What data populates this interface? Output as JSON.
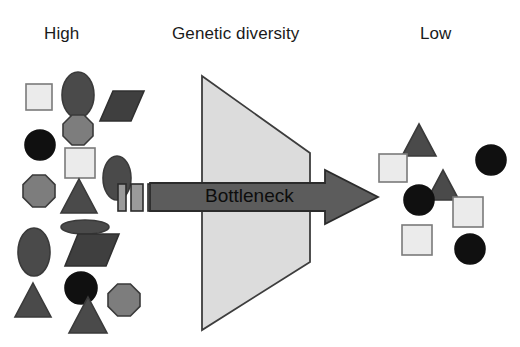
{
  "diagram": {
    "title": "Genetic diversity",
    "left_label": "High",
    "right_label": "Low",
    "arrow_label": "Bottleneck",
    "colors": {
      "background": "#ffffff",
      "text": "#1a1a1a",
      "funnel_fill": "#dcdcdc",
      "funnel_stroke": "#3d3d3d",
      "arrow_fill": "#5c5c5c",
      "arrow_stroke": "#2b2b2b",
      "shape_light": "#ebebeb",
      "shape_mid": "#7d7d7d",
      "shape_dark": "#4a4a4a",
      "shape_black": "#101010",
      "shape_outline": "#3a3a3a"
    },
    "funnel": {
      "points": "202,76 310,153 310,262 202,330",
      "fill": "#dcdcdc",
      "stroke": "#3d3d3d"
    },
    "arrow": {
      "points": "150,183 325,183 325,170 378,197 325,224 325,211 150,211",
      "fill": "#5c5c5c",
      "stroke": "#2b2b2b",
      "label_x": 205,
      "label_y": 197
    },
    "gate_bars": [
      {
        "x": 118,
        "y": 184,
        "w": 8,
        "h": 27,
        "fill": "#9a9a9a"
      },
      {
        "x": 131,
        "y": 184,
        "w": 12,
        "h": 27,
        "fill": "#9a9a9a"
      },
      {
        "x": 148,
        "y": 184,
        "w": 10,
        "h": 27,
        "fill": "#9a9a9a"
      }
    ],
    "left_population": {
      "caption": "High genetic diversity population",
      "shape_type_count": 6,
      "shape_count": 18,
      "shapes": [
        {
          "kind": "square",
          "cx": 39,
          "cy": 97,
          "w": 26,
          "h": 26,
          "fill": "#ebebeb",
          "stroke": "#7a7a7a"
        },
        {
          "kind": "ellipse",
          "cx": 78,
          "cy": 95,
          "w": 32,
          "h": 46,
          "fill": "#4a4a4a",
          "stroke": "#3a3a3a"
        },
        {
          "kind": "parallelogram",
          "cx": 122,
          "cy": 106,
          "w": 44,
          "h": 30,
          "fill": "#3f3f3f",
          "stroke": "#303030",
          "skew": 13
        },
        {
          "kind": "octagon",
          "cx": 78,
          "cy": 130,
          "w": 30,
          "h": 30,
          "fill": "#7d7d7d",
          "stroke": "#3a3a3a"
        },
        {
          "kind": "circle",
          "cx": 40,
          "cy": 145,
          "w": 30,
          "h": 30,
          "fill": "#101010",
          "stroke": "#101010"
        },
        {
          "kind": "square",
          "cx": 80,
          "cy": 163,
          "w": 30,
          "h": 30,
          "fill": "#ebebeb",
          "stroke": "#7a7a7a"
        },
        {
          "kind": "ellipse",
          "cx": 117,
          "cy": 178,
          "w": 28,
          "h": 44,
          "fill": "#4a4a4a",
          "stroke": "#3a3a3a"
        },
        {
          "kind": "octagon",
          "cx": 39,
          "cy": 191,
          "w": 32,
          "h": 32,
          "fill": "#7d7d7d",
          "stroke": "#3a3a3a"
        },
        {
          "kind": "triangle",
          "cx": 79,
          "cy": 196,
          "w": 36,
          "h": 34,
          "fill": "#4a4a4a",
          "stroke": "#3a3a3a"
        },
        {
          "kind": "ellipse",
          "cx": 85,
          "cy": 227,
          "w": 48,
          "h": 14,
          "fill": "#4a4a4a",
          "stroke": "#3a3a3a"
        },
        {
          "kind": "ellipse",
          "cx": 34,
          "cy": 252,
          "w": 32,
          "h": 48,
          "fill": "#4a4a4a",
          "stroke": "#3a3a3a"
        },
        {
          "kind": "parallelogram",
          "cx": 92,
          "cy": 250,
          "w": 54,
          "h": 32,
          "fill": "#3f3f3f",
          "stroke": "#303030",
          "skew": 13
        },
        {
          "kind": "circle",
          "cx": 81,
          "cy": 288,
          "w": 32,
          "h": 32,
          "fill": "#101010",
          "stroke": "#101010"
        },
        {
          "kind": "triangle",
          "cx": 33,
          "cy": 300,
          "w": 36,
          "h": 34,
          "fill": "#4a4a4a",
          "stroke": "#3a3a3a"
        },
        {
          "kind": "triangle",
          "cx": 88,
          "cy": 315,
          "w": 38,
          "h": 36,
          "fill": "#4a4a4a",
          "stroke": "#3a3a3a"
        },
        {
          "kind": "octagon",
          "cx": 124,
          "cy": 300,
          "w": 32,
          "h": 32,
          "fill": "#7d7d7d",
          "stroke": "#3a3a3a"
        }
      ]
    },
    "right_population": {
      "caption": "Low genetic diversity population",
      "shape_type_count": 3,
      "shape_count": 8,
      "shapes": [
        {
          "kind": "triangle",
          "cx": 419,
          "cy": 140,
          "w": 34,
          "h": 32,
          "fill": "#4a4a4a",
          "stroke": "#3a3a3a"
        },
        {
          "kind": "circle",
          "cx": 491,
          "cy": 160,
          "w": 30,
          "h": 30,
          "fill": "#101010",
          "stroke": "#101010"
        },
        {
          "kind": "square",
          "cx": 393,
          "cy": 168,
          "w": 28,
          "h": 28,
          "fill": "#ebebeb",
          "stroke": "#7a7a7a"
        },
        {
          "kind": "triangle",
          "cx": 443,
          "cy": 185,
          "w": 32,
          "h": 30,
          "fill": "#4a4a4a",
          "stroke": "#3a3a3a"
        },
        {
          "kind": "circle",
          "cx": 419,
          "cy": 200,
          "w": 30,
          "h": 30,
          "fill": "#101010",
          "stroke": "#101010"
        },
        {
          "kind": "square",
          "cx": 468,
          "cy": 212,
          "w": 30,
          "h": 30,
          "fill": "#ebebeb",
          "stroke": "#7a7a7a"
        },
        {
          "kind": "square",
          "cx": 417,
          "cy": 240,
          "w": 30,
          "h": 30,
          "fill": "#ebebeb",
          "stroke": "#7a7a7a"
        },
        {
          "kind": "circle",
          "cx": 470,
          "cy": 249,
          "w": 30,
          "h": 30,
          "fill": "#101010",
          "stroke": "#101010"
        }
      ]
    }
  }
}
